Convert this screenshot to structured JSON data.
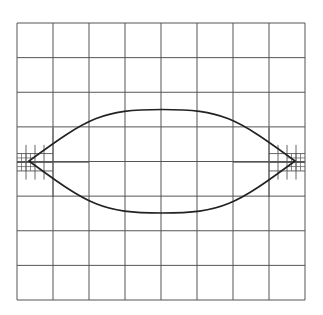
{
  "diagram": {
    "type": "adaptive-quadtree-mesh",
    "domain_box": {
      "x0": 17,
      "y0": 23,
      "x1": 305,
      "y1": 300
    },
    "base_grid": {
      "cols": 8,
      "rows": 8
    },
    "refinement_regions": [
      {
        "side": "left",
        "level": 1,
        "x0": 17,
        "y0": 127.6,
        "x1": 89,
        "y1": 196.9,
        "div": 2
      },
      {
        "side": "left",
        "level": 2,
        "x0": 17,
        "y0": 144.9,
        "x1": 53,
        "y1": 179.6,
        "div": 4
      },
      {
        "side": "left",
        "level": 3,
        "x0": 17,
        "y0": 153.6,
        "x1": 35,
        "y1": 170.9,
        "div": 4
      },
      {
        "side": "right",
        "level": 1,
        "x0": 233,
        "y0": 127.6,
        "x1": 305,
        "y1": 196.9,
        "div": 2
      },
      {
        "side": "right",
        "level": 2,
        "x0": 269,
        "y0": 144.9,
        "x1": 305,
        "y1": 179.6,
        "div": 4
      },
      {
        "side": "right",
        "level": 3,
        "x0": 287,
        "y0": 153.6,
        "x1": 305,
        "y1": 170.9,
        "div": 4
      }
    ],
    "lens_curve": {
      "left_tip": [
        29,
        161
      ],
      "right_tip": [
        295,
        161
      ],
      "top_y": 109.5,
      "bottom_y": 213,
      "stroke": "#222222"
    },
    "grid_color": "#555555"
  }
}
